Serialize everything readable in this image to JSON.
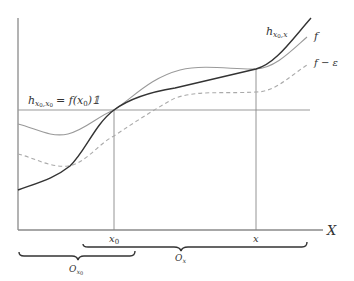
{
  "diagram": {
    "type": "function-approximation-sketch",
    "axis": {
      "x_label": "X"
    },
    "points": {
      "x0_label": "x",
      "x0_sub": "0",
      "x_label": "x"
    },
    "curves": {
      "f_label": "f",
      "f_minus_eps_label": "f − ε",
      "h_x0x": {
        "base": "h",
        "sub": "x",
        "sub_sub": "0",
        "sub_tail": ",x"
      },
      "h_x0x0": {
        "base": "h",
        "sub": "x",
        "sub_sub": "0",
        "sub_tail": ",x",
        "sub_tail_sub": "0",
        "rhs": "= f(x",
        "rhs_sub": "0",
        "rhs_tail": ")𝟙"
      }
    },
    "neighborhoods": {
      "O_x0": {
        "base": "O",
        "sub": "x",
        "sub_sub": "0"
      },
      "O_x": {
        "base": "O",
        "sub": "x"
      }
    },
    "colors": {
      "axis": "#888888",
      "f": "#999999",
      "h": "#333333",
      "f_minus_eps": "#aaaaaa",
      "brace": "#333333"
    }
  }
}
